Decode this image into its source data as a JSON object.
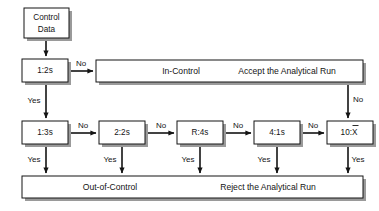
{
  "diagram": {
    "canvas": {
      "width": 379,
      "height": 211,
      "background": "#ffffff"
    },
    "colors": {
      "stroke": "#141414",
      "fill": "#ffffff",
      "shadow": "#9a9a9a",
      "text": "#141414"
    }
  },
  "nodes": {
    "start": {
      "id": "control-data",
      "label_line1": "Control",
      "label_line2": "Data",
      "x": 24,
      "y": 8,
      "w": 45,
      "h": 30
    },
    "rules": [
      {
        "id": "rule-1-2s",
        "label": "1:2s",
        "x": 22,
        "y": 59,
        "w": 46,
        "h": 23
      },
      {
        "id": "rule-1-3s",
        "label": "1:3s",
        "x": 22,
        "y": 121,
        "w": 46,
        "h": 23
      },
      {
        "id": "rule-2-2s",
        "label": "2:2s",
        "x": 99,
        "y": 121,
        "w": 46,
        "h": 23
      },
      {
        "id": "rule-r-4s",
        "label": "R:4s",
        "x": 177,
        "y": 121,
        "w": 46,
        "h": 23
      },
      {
        "id": "rule-4-1s",
        "label": "4:1s",
        "x": 254,
        "y": 121,
        "w": 46,
        "h": 23
      },
      {
        "id": "rule-10-xbar",
        "label": "10:X",
        "overbar": true,
        "x": 327,
        "y": 121,
        "w": 46,
        "h": 23
      }
    ],
    "bars": [
      {
        "id": "in-control-bar",
        "x": 96,
        "y": 60,
        "w": 267,
        "h": 22,
        "text_left": "In-Control",
        "text_right": "Accept the Analytical Run",
        "text_left_cx": 181,
        "text_right_cx": 287
      },
      {
        "id": "out-of-control-bar",
        "x": 22,
        "y": 176,
        "w": 341,
        "h": 22,
        "text_left": "Out-of-Control",
        "text_right": "Reject the Analytical Run",
        "text_left_cx": 110,
        "text_right_cx": 268
      }
    ]
  },
  "edge_labels": {
    "no_from_1_2s": "No",
    "no_1_3s_to_2_2s": "No",
    "no_2_2s_to_r_4s": "No",
    "no_r_4s_to_4_1s": "No",
    "no_4_1s_to_10_xbar": "No",
    "no_accept_down": "No",
    "yes_1_2s": "Yes",
    "yes_1_3s": "Yes",
    "yes_2_2s": "Yes",
    "yes_r_4s": "Yes",
    "yes_4_1s": "Yes",
    "yes_10_xbar": "Yes"
  },
  "edge_label_positions": {
    "no_from_1_2s": {
      "x": 81,
      "y": 64
    },
    "no_1_3s_to_2_2s": {
      "x": 83,
      "y": 126
    },
    "no_2_2s_to_r_4s": {
      "x": 161,
      "y": 126
    },
    "no_r_4s_to_4_1s": {
      "x": 238,
      "y": 126
    },
    "no_4_1s_to_10_xbar": {
      "x": 313,
      "y": 126
    },
    "no_accept_down": {
      "x": 357,
      "y": 100
    },
    "yes_1_2s": {
      "x": 34,
      "y": 101
    },
    "yes_1_3s": {
      "x": 34,
      "y": 160
    },
    "yes_2_2s": {
      "x": 110,
      "y": 160
    },
    "yes_r_4s": {
      "x": 188,
      "y": 160
    },
    "yes_4_1s": {
      "x": 264,
      "y": 160
    },
    "yes_10_xbar": {
      "x": 357,
      "y": 160
    }
  }
}
